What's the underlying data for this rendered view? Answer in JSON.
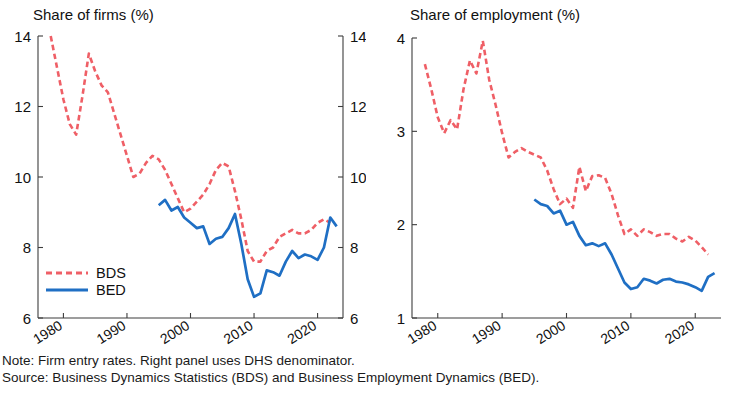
{
  "figure": {
    "width": 732,
    "height": 400,
    "background": "#ffffff"
  },
  "colors": {
    "bds": "#ef5f66",
    "bed": "#1f6fc4",
    "axis": "#3d3d3d",
    "text": "#111111"
  },
  "notes": {
    "note": "Note: Firm entry rates. Right panel uses DHS denominator.",
    "source": "Source: Business Dynamics Statistics (BDS) and Business Employment Dynamics (BED)."
  },
  "legend": {
    "entries": [
      {
        "label": "BDS",
        "style": "dashed",
        "color": "#ef5f66"
      },
      {
        "label": "BED",
        "style": "solid",
        "color": "#1f6fc4"
      }
    ]
  },
  "chart_data": [
    {
      "id": "share-of-firms",
      "type": "line",
      "title": "Share of firms (%)",
      "xlabel": "",
      "ylabel": "",
      "xlim": [
        1976,
        2024
      ],
      "ylim": [
        6,
        14
      ],
      "yticks": [
        6,
        8,
        10,
        12,
        14
      ],
      "xticks": [
        1980,
        1990,
        2000,
        2010,
        2020
      ],
      "xtick_labels": [
        "1980",
        "1990",
        "2000",
        "2010",
        "2020"
      ],
      "ytick_labels": [
        "6",
        "8",
        "10",
        "12",
        "14"
      ],
      "grid": false,
      "mirror_y_axis": true,
      "legend_position": "lower left",
      "series": [
        {
          "name": "BDS",
          "style": "dashed",
          "color": "#ef5f66",
          "x": [
            1978,
            1979,
            1980,
            1981,
            1982,
            1983,
            1984,
            1985,
            1986,
            1987,
            1988,
            1989,
            1990,
            1991,
            1992,
            1993,
            1994,
            1995,
            1996,
            1997,
            1998,
            1999,
            2000,
            2001,
            2002,
            2003,
            2004,
            2005,
            2006,
            2007,
            2008,
            2009,
            2010,
            2011,
            2012,
            2013,
            2014,
            2015,
            2016,
            2017,
            2018,
            2019,
            2020,
            2021,
            2022
          ],
          "values": [
            14.0,
            13.1,
            12.2,
            11.5,
            11.2,
            12.3,
            13.5,
            13.0,
            12.6,
            12.4,
            11.8,
            11.2,
            10.6,
            10.0,
            10.1,
            10.4,
            10.6,
            10.5,
            10.2,
            9.8,
            9.4,
            9.0,
            9.1,
            9.3,
            9.5,
            9.8,
            10.2,
            10.4,
            10.3,
            9.6,
            8.8,
            7.9,
            7.6,
            7.6,
            7.9,
            8.0,
            8.3,
            8.4,
            8.5,
            8.4,
            8.4,
            8.5,
            8.7,
            8.8,
            8.7
          ]
        },
        {
          "name": "BED",
          "style": "solid",
          "color": "#1f6fc4",
          "x": [
            1995,
            1996,
            1997,
            1998,
            1999,
            2000,
            2001,
            2002,
            2003,
            2004,
            2005,
            2006,
            2007,
            2008,
            2009,
            2010,
            2011,
            2012,
            2013,
            2014,
            2015,
            2016,
            2017,
            2018,
            2019,
            2020,
            2021,
            2022,
            2023
          ],
          "values": [
            9.2,
            9.35,
            9.05,
            9.15,
            8.85,
            8.7,
            8.55,
            8.6,
            8.1,
            8.25,
            8.3,
            8.55,
            8.95,
            8.1,
            7.1,
            6.6,
            6.7,
            7.35,
            7.3,
            7.2,
            7.6,
            7.9,
            7.7,
            7.8,
            7.75,
            7.65,
            8.0,
            8.85,
            8.6
          ]
        }
      ]
    },
    {
      "id": "share-of-employment",
      "type": "line",
      "title": "Share of employment (%)",
      "xlabel": "",
      "ylabel": "",
      "xlim": [
        1976,
        2024
      ],
      "ylim": [
        1,
        4
      ],
      "yticks": [
        1,
        2,
        3,
        4
      ],
      "xticks": [
        1980,
        1990,
        2000,
        2010,
        2020
      ],
      "xtick_labels": [
        "1980",
        "1990",
        "2000",
        "2010",
        "2020"
      ],
      "ytick_labels": [
        "1",
        "2",
        "3",
        "4"
      ],
      "grid": false,
      "mirror_y_axis": false,
      "legend_position": "none",
      "series": [
        {
          "name": "BDS",
          "style": "dashed",
          "color": "#ef5f66",
          "x": [
            1978,
            1979,
            1980,
            1981,
            1982,
            1983,
            1984,
            1985,
            1986,
            1987,
            1988,
            1989,
            1990,
            1991,
            1992,
            1993,
            1994,
            1995,
            1996,
            1997,
            1998,
            1999,
            2000,
            2001,
            2002,
            2003,
            2004,
            2005,
            2006,
            2007,
            2008,
            2009,
            2010,
            2011,
            2012,
            2013,
            2014,
            2015,
            2016,
            2017,
            2018,
            2019,
            2020,
            2021,
            2022
          ],
          "values": [
            3.72,
            3.45,
            3.15,
            2.98,
            3.12,
            3.02,
            3.45,
            3.76,
            3.62,
            3.97,
            3.55,
            3.28,
            2.98,
            2.72,
            2.78,
            2.82,
            2.78,
            2.75,
            2.72,
            2.58,
            2.38,
            2.22,
            2.28,
            2.18,
            2.62,
            2.36,
            2.52,
            2.53,
            2.5,
            2.33,
            2.1,
            1.9,
            1.95,
            1.88,
            1.95,
            1.92,
            1.88,
            1.9,
            1.9,
            1.85,
            1.82,
            1.87,
            1.83,
            1.76,
            1.68
          ]
        },
        {
          "name": "BED",
          "style": "solid",
          "color": "#1f6fc4",
          "x": [
            1995,
            1996,
            1997,
            1998,
            1999,
            2000,
            2001,
            2002,
            2003,
            2004,
            2005,
            2006,
            2007,
            2008,
            2009,
            2010,
            2011,
            2012,
            2013,
            2014,
            2015,
            2016,
            2017,
            2018,
            2019,
            2020,
            2021,
            2022,
            2023
          ],
          "values": [
            2.27,
            2.22,
            2.2,
            2.12,
            2.15,
            2.0,
            2.03,
            1.88,
            1.78,
            1.8,
            1.77,
            1.8,
            1.68,
            1.53,
            1.38,
            1.31,
            1.33,
            1.42,
            1.4,
            1.37,
            1.41,
            1.42,
            1.39,
            1.38,
            1.36,
            1.33,
            1.29,
            1.44,
            1.48
          ]
        }
      ]
    }
  ]
}
